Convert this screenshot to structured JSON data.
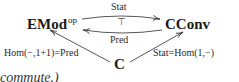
{
  "diagram": {
    "objects": {
      "emod": {
        "label": "EMod",
        "superscript": "op"
      },
      "cconv": {
        "label": "CConv"
      },
      "c": {
        "label": "C"
      }
    },
    "arrows": {
      "top": {
        "from": "EMod^op",
        "to": "CConv",
        "label": "Stat"
      },
      "bottom": {
        "from": "CConv",
        "to": "EMod^op",
        "label": "Pred"
      },
      "adjunction": {
        "symbol": "⊤"
      },
      "left": {
        "from": "C",
        "to": "EMod^op",
        "label": "Hom(−,1+1)=Pred"
      },
      "right": {
        "from": "C",
        "to": "CConv",
        "label": "Stat=Hom(1,−)"
      }
    }
  },
  "text_fragment": "commute.)",
  "colors": {
    "ink": "#1a1a1a",
    "arrow": "#444444",
    "background": "#ffffff"
  }
}
